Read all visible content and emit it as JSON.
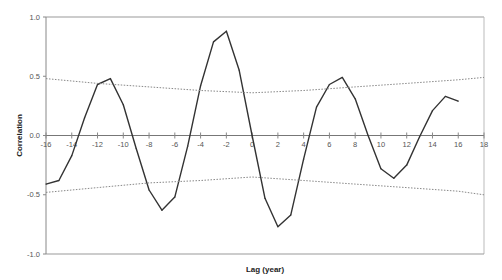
{
  "chart_data": {
    "type": "line",
    "title": "",
    "xlabel": "Lag (year)",
    "ylabel": "Correlation",
    "xlim": [
      -16,
      18
    ],
    "ylim": [
      -1.0,
      1.0
    ],
    "x_ticks": [
      -16,
      -14,
      -12,
      -10,
      -8,
      -6,
      -4,
      -2,
      0,
      2,
      4,
      6,
      8,
      10,
      12,
      14,
      16,
      18
    ],
    "x_tick_labels": [
      "-16",
      "-14",
      "-12",
      "-10",
      "-8",
      "-6",
      "-4",
      "-2",
      "0",
      "2",
      "4",
      "6",
      "8",
      "10",
      "12",
      "14",
      "16",
      "18"
    ],
    "y_ticks": [
      1.0,
      0.5,
      0.0,
      -0.5,
      -1.0
    ],
    "y_tick_labels": [
      "1.0",
      "0.5",
      "0.0",
      "-0.5",
      "-1.0"
    ],
    "grid": false,
    "legend": "none",
    "series": [
      {
        "name": "Correlation",
        "style": "solid",
        "color": "#333333",
        "x": [
          -16,
          -15,
          -14,
          -13,
          -12,
          -11,
          -10,
          -9,
          -8,
          -7,
          -6,
          -5,
          -4,
          -3,
          -2,
          -1,
          0,
          1,
          2,
          3,
          4,
          5,
          6,
          7,
          8,
          9,
          10,
          11,
          12,
          13,
          14,
          15,
          16,
          17,
          18
        ],
        "values": [
          -0.41,
          -0.38,
          -0.17,
          0.15,
          0.43,
          0.48,
          0.26,
          -0.11,
          -0.46,
          -0.63,
          -0.52,
          -0.09,
          0.42,
          0.79,
          0.88,
          0.55,
          0.0,
          -0.53,
          -0.77,
          -0.67,
          -0.2,
          0.24,
          0.43,
          0.49,
          0.31,
          0.0,
          -0.28,
          -0.36,
          -0.25,
          -0.01,
          0.21,
          0.33,
          0.29,
          null,
          null
        ]
      },
      {
        "name": "Upper confidence limit",
        "style": "dotted",
        "color": "#888888",
        "x": [
          -16,
          -12,
          -8,
          -4,
          0,
          4,
          8,
          12,
          16,
          18
        ],
        "values": [
          0.48,
          0.44,
          0.41,
          0.38,
          0.36,
          0.38,
          0.41,
          0.44,
          0.47,
          0.49
        ]
      },
      {
        "name": "Lower confidence limit",
        "style": "dotted",
        "color": "#888888",
        "x": [
          -16,
          -12,
          -8,
          -4,
          0,
          4,
          8,
          12,
          16,
          18
        ],
        "values": [
          -0.48,
          -0.44,
          -0.4,
          -0.38,
          -0.35,
          -0.38,
          -0.41,
          -0.44,
          -0.47,
          -0.5
        ]
      }
    ]
  }
}
